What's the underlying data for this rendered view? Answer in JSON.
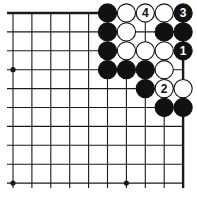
{
  "diagram": {
    "type": "go-board-corner",
    "columns": 10,
    "rows": 10,
    "edges": [
      "top",
      "right"
    ],
    "colors": {
      "line": "#1a1a1a",
      "black_stone": "#111111",
      "white_stone": "#ffffff",
      "background": "#ffffff"
    },
    "star_points": [
      [
        0,
        3
      ],
      [
        0,
        9
      ],
      [
        6,
        9
      ]
    ],
    "stones": [
      {
        "col": 5,
        "row": 0,
        "color": "black",
        "label": ""
      },
      {
        "col": 6,
        "row": 0,
        "color": "white",
        "label": ""
      },
      {
        "col": 7,
        "row": 0,
        "color": "white",
        "label": "4"
      },
      {
        "col": 8,
        "row": 0,
        "color": "white",
        "label": ""
      },
      {
        "col": 9,
        "row": 0,
        "color": "black",
        "label": "3"
      },
      {
        "col": 5,
        "row": 1,
        "color": "black",
        "label": ""
      },
      {
        "col": 6,
        "row": 1,
        "color": "white",
        "label": ""
      },
      {
        "col": 8,
        "row": 1,
        "color": "black",
        "label": ""
      },
      {
        "col": 9,
        "row": 1,
        "color": "black",
        "label": ""
      },
      {
        "col": 5,
        "row": 2,
        "color": "black",
        "label": ""
      },
      {
        "col": 6,
        "row": 2,
        "color": "white",
        "label": ""
      },
      {
        "col": 7,
        "row": 2,
        "color": "white",
        "label": ""
      },
      {
        "col": 8,
        "row": 2,
        "color": "white",
        "label": ""
      },
      {
        "col": 9,
        "row": 2,
        "color": "black",
        "label": "1"
      },
      {
        "col": 5,
        "row": 3,
        "color": "black",
        "label": ""
      },
      {
        "col": 6,
        "row": 3,
        "color": "black",
        "label": ""
      },
      {
        "col": 7,
        "row": 3,
        "color": "black",
        "label": ""
      },
      {
        "col": 8,
        "row": 3,
        "color": "white",
        "label": ""
      },
      {
        "col": 7,
        "row": 4,
        "color": "black",
        "label": ""
      },
      {
        "col": 8,
        "row": 4,
        "color": "white",
        "label": "2"
      },
      {
        "col": 9,
        "row": 4,
        "color": "white",
        "label": ""
      },
      {
        "col": 8,
        "row": 5,
        "color": "black",
        "label": ""
      },
      {
        "col": 9,
        "row": 5,
        "color": "black",
        "label": ""
      }
    ]
  }
}
